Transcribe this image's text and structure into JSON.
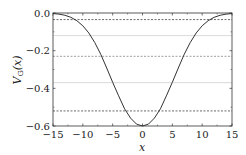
{
  "chart_data": {
    "type": "line",
    "title": "",
    "xlabel": "x",
    "ylabel": "V_G(x)",
    "xlim": [
      -15,
      15
    ],
    "ylim": [
      -0.6,
      0.0
    ],
    "xticks": [
      -15,
      -10,
      -5,
      0,
      5,
      10,
      15
    ],
    "xtick_labels": [
      "−15",
      "−10",
      "−5",
      "0",
      "5",
      "10",
      "15"
    ],
    "yticks": [
      0.0,
      -0.2,
      -0.4,
      -0.6
    ],
    "ytick_labels": [
      "0.0",
      "−0.2",
      "−0.4",
      "−0.6"
    ],
    "grid": false,
    "legend": null,
    "series": [
      {
        "name": "V_G(x)",
        "style": "solid",
        "color": "#333333",
        "x": [
          -15,
          -14,
          -13,
          -12,
          -11,
          -10,
          -9,
          -8,
          -7,
          -6,
          -5,
          -4,
          -3,
          -2,
          -1,
          0,
          1,
          2,
          3,
          4,
          5,
          6,
          7,
          8,
          9,
          10,
          11,
          12,
          13,
          14,
          15
        ],
        "y": [
          -0.003,
          -0.006,
          -0.012,
          -0.023,
          -0.041,
          -0.068,
          -0.106,
          -0.157,
          -0.219,
          -0.292,
          -0.368,
          -0.44,
          -0.509,
          -0.558,
          -0.59,
          -0.6,
          -0.59,
          -0.558,
          -0.509,
          -0.44,
          -0.368,
          -0.292,
          -0.219,
          -0.157,
          -0.106,
          -0.068,
          -0.041,
          -0.023,
          -0.012,
          -0.006,
          -0.003
        ]
      }
    ],
    "horizontal_lines": [
      {
        "y": -0.035,
        "style": "dashed",
        "color": "#444444"
      },
      {
        "y": -0.12,
        "style": "solid",
        "color": "#cfcfcf"
      },
      {
        "y": -0.23,
        "style": "dashed",
        "color": "#888888"
      },
      {
        "y": -0.37,
        "style": "solid",
        "color": "#cfcfcf"
      },
      {
        "y": -0.52,
        "style": "dashed",
        "color": "#444444"
      }
    ]
  }
}
